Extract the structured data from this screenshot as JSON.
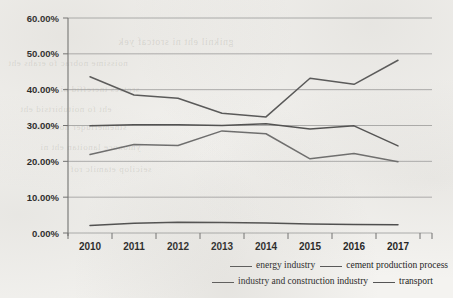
{
  "chart_data": {
    "type": "line",
    "title": "",
    "xlabel": "",
    "ylabel": "",
    "categories": [
      "2010",
      "2011",
      "2012",
      "2013",
      "2014",
      "2015",
      "2016",
      "2017"
    ],
    "ytick_labels": [
      "0.00%",
      "10.00%",
      "20.00%",
      "30.00%",
      "40.00%",
      "50.00%",
      "60.00%"
    ],
    "ytick_values": [
      0,
      10,
      20,
      30,
      40,
      50,
      60
    ],
    "ylim": [
      0,
      60
    ],
    "grid": true,
    "legend_position": "bottom",
    "series": [
      {
        "name": "energy industry",
        "color": "#555555",
        "values": [
          43.6,
          38.5,
          37.6,
          33.4,
          32.4,
          43.2,
          41.5,
          48.2
        ]
      },
      {
        "name": "cement production process",
        "color": "#4d4d4d",
        "values": [
          29.9,
          30.2,
          30.2,
          30.0,
          30.5,
          29.0,
          29.9,
          24.3
        ]
      },
      {
        "name": "industry and construction industry",
        "color": "#6b6b6b",
        "values": [
          21.9,
          24.7,
          24.4,
          28.5,
          27.7,
          20.7,
          22.2,
          19.9
        ]
      },
      {
        "name": "transport",
        "color": "#4a4a4a",
        "values": [
          2.1,
          2.7,
          3.0,
          2.9,
          2.8,
          2.5,
          2.4,
          2.3
        ]
      }
    ]
  },
  "legend": {
    "row1": [
      {
        "label": "energy industry"
      },
      {
        "label": "cement production process"
      }
    ],
    "row2": [
      {
        "label": "industry and construction industry"
      },
      {
        "label": "transport"
      }
    ]
  },
  "colors": {
    "page_background": "#f4f3f0",
    "axis": "#6e6e6e",
    "gridline": "#9a9a9a",
    "text": "#1f1f1f"
  }
}
